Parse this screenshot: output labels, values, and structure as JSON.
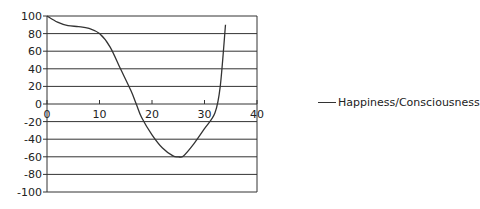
{
  "chart_data": {
    "type": "line",
    "title": "",
    "xlabel": "",
    "ylabel": "",
    "xlim": [
      0,
      40
    ],
    "ylim": [
      -100,
      100
    ],
    "x_ticks": [
      0,
      10,
      20,
      30,
      40
    ],
    "y_ticks": [
      100,
      80,
      60,
      40,
      20,
      0,
      -20,
      -40,
      -60,
      -80,
      -100
    ],
    "grid": {
      "horizontal": true,
      "vertical": false
    },
    "legend_position": "right",
    "series": [
      {
        "name": "Happiness/Consciousness",
        "color": "#333333",
        "x": [
          0,
          2,
          4,
          6,
          8,
          10,
          12,
          14,
          16,
          17,
          18,
          20,
          22,
          24,
          25,
          26,
          28,
          30,
          32,
          33,
          34
        ],
        "values": [
          100,
          93,
          89,
          88,
          86,
          80,
          65,
          40,
          15,
          0,
          -15,
          -35,
          -50,
          -59,
          -60,
          -59,
          -45,
          -28,
          -10,
          20,
          90
        ]
      }
    ]
  },
  "legend": {
    "label": "Happiness/Consciousness"
  }
}
